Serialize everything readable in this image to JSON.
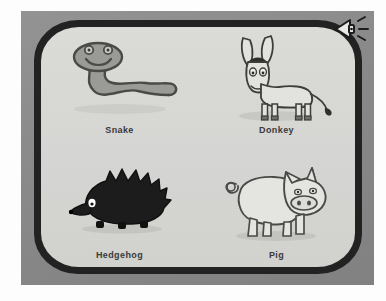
{
  "app": {
    "screen_background": "#d9d9d6",
    "bezel_color": "#8a8a8a",
    "border_color": "#222222",
    "label_color": "#3a3a3a"
  },
  "toolbar": {
    "sound_icon": "speaker-icon",
    "sound_label": "Sound"
  },
  "items": [
    {
      "id": "snake",
      "label": "Snake",
      "icon": "snake-illustration",
      "body_color": "#9a9a96",
      "outline_color": "#4a4a48"
    },
    {
      "id": "donkey",
      "label": "Donkey",
      "icon": "donkey-illustration",
      "body_color": "#e2e2df",
      "outline_color": "#3d3d3b",
      "mane_color": "#2f2f2d"
    },
    {
      "id": "hedgehog",
      "label": "Hedgehog",
      "icon": "hedgehog-illustration",
      "body_color": "#1c1c1c",
      "outline_color": "#111111",
      "eye_color": "#ffffff"
    },
    {
      "id": "pig",
      "label": "Pig",
      "icon": "pig-illustration",
      "body_color": "#e4e4e1",
      "outline_color": "#4a4a48"
    }
  ]
}
